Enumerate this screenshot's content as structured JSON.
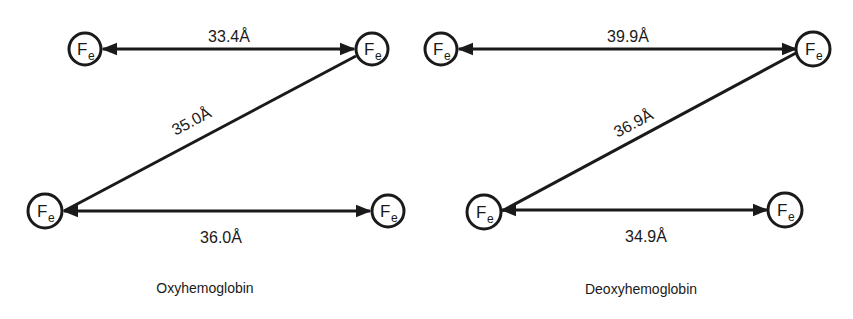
{
  "colors": {
    "ink": "#1a1a1a",
    "background": "#ffffff"
  },
  "atom_label": {
    "main": "F",
    "sub": "e"
  },
  "angstrom_unit": "Å",
  "diagrams": [
    {
      "caption": "Oxyhemoglobin",
      "distances": {
        "top": "33.4Å",
        "diagonal": "35.0Å",
        "bottom": "36.0Å"
      }
    },
    {
      "caption": "Deoxyhemoglobin",
      "distances": {
        "top": "39.9Å",
        "diagonal": "36.9Å",
        "bottom": "34.9Å"
      }
    }
  ]
}
